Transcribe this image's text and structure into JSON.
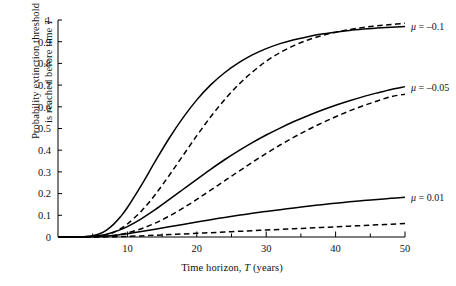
{
  "chart_data": {
    "type": "line",
    "title": "",
    "xlabel": "Time horizon, T (years)",
    "ylabel": "Probability extinction threshold is reached before time T",
    "ylabel_line1": "Probability extinction threshold",
    "ylabel_line2": "is reached before time T",
    "xlim": [
      0,
      50
    ],
    "ylim": [
      0,
      1
    ],
    "grid": false,
    "legend_position": "right-inline",
    "x_ticks_major": [
      10,
      20,
      30,
      40,
      50
    ],
    "x_ticks_minor": [
      5,
      15,
      25,
      35,
      45
    ],
    "x_tick_labels": [
      "10",
      "20",
      "30",
      "40",
      "50"
    ],
    "y_ticks": [
      0,
      0.1,
      0.2,
      0.3,
      0.4,
      0.5,
      0.6,
      0.7,
      0.8,
      0.9,
      1
    ],
    "y_tick_labels": [
      "0",
      "0.1",
      "0.2",
      "0.3",
      "0.4",
      "0.5",
      "0.6",
      "0.7",
      "0.8",
      "0.9",
      "1"
    ],
    "x": [
      0,
      2,
      4,
      5,
      6,
      7,
      8,
      9,
      10,
      12,
      14,
      16,
      18,
      20,
      22,
      24,
      26,
      28,
      30,
      32,
      34,
      36,
      38,
      40,
      42,
      44,
      46,
      48,
      50
    ],
    "series": [
      {
        "name": "mu = -0.1 solid",
        "label": "μ = –0.1",
        "style": "solid",
        "values": [
          0,
          0,
          0.002,
          0.006,
          0.015,
          0.032,
          0.058,
          0.093,
          0.136,
          0.238,
          0.348,
          0.454,
          0.549,
          0.632,
          0.701,
          0.757,
          0.802,
          0.839,
          0.868,
          0.891,
          0.909,
          0.923,
          0.935,
          0.944,
          0.952,
          0.958,
          0.963,
          0.967,
          0.97
        ]
      },
      {
        "name": "mu = -0.1 dashed",
        "style": "dashed",
        "values": [
          0,
          0,
          0.001,
          0.002,
          0.005,
          0.011,
          0.022,
          0.038,
          0.06,
          0.119,
          0.195,
          0.283,
          0.375,
          0.467,
          0.554,
          0.633,
          0.702,
          0.76,
          0.81,
          0.85,
          0.882,
          0.908,
          0.928,
          0.944,
          0.956,
          0.966,
          0.973,
          0.979,
          0.985
        ]
      },
      {
        "name": "mu = -0.05 solid",
        "label": "μ = –0.05",
        "style": "solid",
        "values": [
          0,
          0,
          0.001,
          0.003,
          0.007,
          0.013,
          0.022,
          0.034,
          0.048,
          0.084,
          0.126,
          0.172,
          0.219,
          0.266,
          0.312,
          0.356,
          0.397,
          0.435,
          0.47,
          0.502,
          0.532,
          0.559,
          0.584,
          0.607,
          0.628,
          0.647,
          0.664,
          0.68,
          0.693
        ]
      },
      {
        "name": "mu = -0.05 dashed",
        "style": "dashed",
        "values": [
          0,
          0,
          0,
          0.001,
          0.002,
          0.004,
          0.007,
          0.012,
          0.019,
          0.038,
          0.064,
          0.096,
          0.133,
          0.173,
          0.216,
          0.259,
          0.302,
          0.344,
          0.385,
          0.424,
          0.46,
          0.494,
          0.525,
          0.554,
          0.581,
          0.605,
          0.627,
          0.647,
          0.658
        ]
      },
      {
        "name": "mu = 0.01 solid",
        "label": "μ = 0.01",
        "style": "solid",
        "values": [
          0,
          0,
          0,
          0.001,
          0.002,
          0.004,
          0.007,
          0.011,
          0.015,
          0.025,
          0.036,
          0.047,
          0.058,
          0.069,
          0.08,
          0.09,
          0.1,
          0.109,
          0.118,
          0.126,
          0.134,
          0.142,
          0.149,
          0.156,
          0.162,
          0.168,
          0.173,
          0.178,
          0.183
        ]
      },
      {
        "name": "mu = 0.01 dashed",
        "style": "dashed",
        "values": [
          0,
          0,
          0,
          0,
          0,
          0.001,
          0.001,
          0.002,
          0.003,
          0.005,
          0.008,
          0.011,
          0.014,
          0.017,
          0.02,
          0.023,
          0.026,
          0.029,
          0.032,
          0.035,
          0.038,
          0.041,
          0.044,
          0.047,
          0.05,
          0.053,
          0.056,
          0.059,
          0.062
        ]
      }
    ],
    "annotations": [
      {
        "text": "μ = –0.1",
        "x": 50,
        "y": 0.97
      },
      {
        "text": "μ = –0.05",
        "x": 50,
        "y": 0.69
      },
      {
        "text": "μ = 0.01",
        "x": 50,
        "y": 0.18
      }
    ]
  },
  "colors": {
    "axis": "#000000",
    "curve": "#000000",
    "background": "#ffffff"
  }
}
